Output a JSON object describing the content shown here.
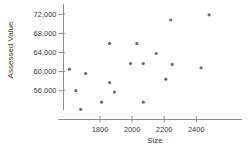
{
  "chart_data": {
    "type": "scatter",
    "title": "",
    "xlabel": "Size",
    "ylabel": "Assessed Value",
    "x": [
      1610,
      1650,
      1680,
      1710,
      1810,
      1860,
      1860,
      1890,
      1990,
      2030,
      2070,
      2070,
      2150,
      2210,
      2240,
      2250,
      2430,
      2480
    ],
    "y": [
      60500,
      56000,
      52100,
      59600,
      53600,
      65900,
      57700,
      55700,
      61700,
      65900,
      61700,
      53600,
      63800,
      58400,
      70800,
      61500,
      60800,
      71900
    ],
    "xlim": [
      1540,
      2560
    ],
    "ylim": [
      51500,
      74000
    ],
    "grid": false,
    "legend": "none",
    "x_ticks": [
      {
        "value": 1800,
        "label": "1800"
      },
      {
        "value": 2000,
        "label": "2000"
      },
      {
        "value": 2200,
        "label": "2200"
      },
      {
        "value": 2400,
        "label": "2400"
      }
    ],
    "y_ticks": [
      {
        "value": 56000,
        "label": "56,000"
      },
      {
        "value": 60000,
        "label": "60,000"
      },
      {
        "value": 64000,
        "label": "64,000"
      },
      {
        "value": 68000,
        "label": "68,000"
      },
      {
        "value": 72000,
        "label": "72,000"
      }
    ],
    "point_color": "#6e6e6e",
    "axis_color": "#8f8f8f",
    "label_color": "#3d3d3d"
  }
}
